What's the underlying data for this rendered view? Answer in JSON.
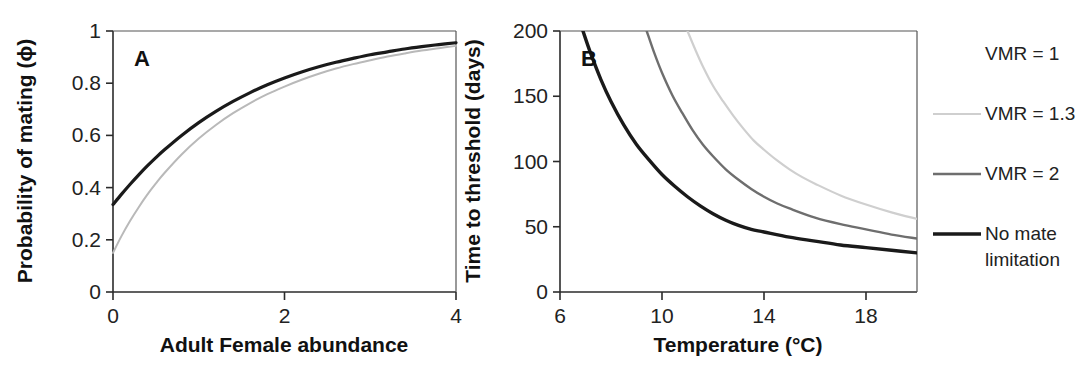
{
  "figure": {
    "background": "#ffffff",
    "panel_letters": {
      "a": "A",
      "b": "B"
    }
  },
  "chart_data": [
    {
      "id": "panel-a",
      "type": "line",
      "panel": "A",
      "title": "",
      "xlabel": "Adult Female abundance",
      "ylabel": "Probability of mating (ϕ)",
      "xlim": [
        0,
        4
      ],
      "ylim": [
        0,
        1
      ],
      "xticks": [
        0,
        2,
        4
      ],
      "xticklabels": [
        "0",
        "2",
        "4"
      ],
      "yticks": [
        0,
        0.2,
        0.4,
        0.6,
        0.8,
        1
      ],
      "yticklabels": [
        "0",
        "0.2",
        "0.4",
        "0.6",
        "0.8",
        "1"
      ],
      "grid": false,
      "legend": "none",
      "series": [
        {
          "name": "No mate limitation",
          "color": "#1a1a1a",
          "width": 3.2,
          "x": [
            0,
            0.1,
            0.2,
            0.3,
            0.4,
            0.5,
            0.6,
            0.8,
            1.0,
            1.2,
            1.4,
            1.6,
            1.8,
            2.0,
            2.2,
            2.4,
            2.6,
            2.8,
            3.0,
            3.2,
            3.4,
            3.6,
            3.8,
            4.0
          ],
          "y": [
            0.335,
            0.375,
            0.413,
            0.449,
            0.483,
            0.515,
            0.545,
            0.6,
            0.649,
            0.692,
            0.73,
            0.764,
            0.794,
            0.82,
            0.843,
            0.863,
            0.88,
            0.895,
            0.909,
            0.92,
            0.931,
            0.94,
            0.948,
            0.955
          ]
        },
        {
          "name": "Mate limited",
          "color": "#b9b9b9",
          "width": 2.0,
          "x": [
            0,
            0.1,
            0.2,
            0.3,
            0.4,
            0.5,
            0.6,
            0.8,
            1.0,
            1.2,
            1.4,
            1.6,
            1.8,
            2.0,
            2.2,
            2.4,
            2.6,
            2.8,
            3.0,
            3.2,
            3.4,
            3.6,
            3.8,
            4.0
          ],
          "y": [
            0.15,
            0.215,
            0.273,
            0.325,
            0.373,
            0.416,
            0.456,
            0.527,
            0.588,
            0.64,
            0.685,
            0.724,
            0.758,
            0.787,
            0.813,
            0.836,
            0.856,
            0.873,
            0.888,
            0.902,
            0.914,
            0.925,
            0.934,
            0.943
          ]
        }
      ]
    },
    {
      "id": "panel-b",
      "type": "line",
      "panel": "B",
      "title": "",
      "xlabel": "Temperature (°C)",
      "ylabel": "Time to threshold (days)",
      "xlim": [
        6,
        20
      ],
      "ylim": [
        0,
        200
      ],
      "xticks": [
        6,
        10,
        14,
        18
      ],
      "xticklabels": [
        "6",
        "10",
        "14",
        "18"
      ],
      "yticks": [
        0,
        50,
        100,
        150,
        200
      ],
      "yticklabels": [
        "0",
        "50",
        "100",
        "150",
        "200"
      ],
      "grid": false,
      "legend": "right",
      "series": [
        {
          "name": "No mate limitation",
          "color": "#1a1a1a",
          "width": 3.4,
          "x": [
            6.9,
            7.2,
            7.6,
            8.0,
            8.5,
            9.0,
            9.5,
            10.0,
            10.5,
            11.0,
            11.5,
            12.0,
            12.5,
            13.0,
            13.5,
            14.0,
            15.0,
            16.0,
            17.0,
            18.0,
            19.0,
            20.0
          ],
          "y": [
            200,
            183,
            163,
            146,
            128,
            113,
            101,
            90,
            81,
            73,
            66,
            60,
            55,
            51,
            48,
            46,
            42,
            39,
            36,
            34,
            32,
            30
          ]
        },
        {
          "name": "VMR = 2",
          "color": "#6e6e6e",
          "width": 2.4,
          "x": [
            9.4,
            9.7,
            10.0,
            10.4,
            10.8,
            11.2,
            11.6,
            12.0,
            12.5,
            13.0,
            13.5,
            14.0,
            14.5,
            15.0,
            16.0,
            17.0,
            18.0,
            19.0,
            20.0
          ],
          "y": [
            200,
            183,
            168,
            151,
            137,
            124,
            113,
            104,
            94,
            86,
            79,
            73,
            68,
            64,
            57,
            52,
            48,
            44,
            41
          ]
        },
        {
          "name": "VMR = 1.3",
          "color": "#cfcfcf",
          "width": 2.2,
          "x": [
            11.0,
            11.3,
            11.6,
            12.0,
            12.4,
            12.8,
            13.2,
            13.6,
            14.0,
            14.5,
            15.0,
            15.5,
            16.0,
            17.0,
            18.0,
            19.0,
            20.0
          ],
          "y": [
            200,
            186,
            173,
            158,
            146,
            135,
            125,
            116,
            109,
            101,
            94,
            88,
            83,
            74,
            67,
            61,
            56
          ]
        }
      ]
    }
  ],
  "legend": {
    "position": "right",
    "entries": [
      {
        "label": "VMR = 1",
        "color": "#ffffff",
        "width": 2.0,
        "swatch_visible": false
      },
      {
        "label": "VMR = 1.3",
        "color": "#cfcfcf",
        "width": 2.2,
        "swatch_visible": true
      },
      {
        "label": "VMR = 2",
        "color": "#6e6e6e",
        "width": 2.4,
        "swatch_visible": true
      },
      {
        "label": "No mate",
        "label2": "limitation",
        "color": "#1a1a1a",
        "width": 3.6,
        "swatch_visible": true
      }
    ]
  }
}
